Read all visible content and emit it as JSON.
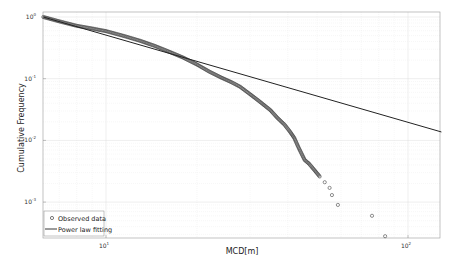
{
  "chart_data": {
    "type": "scatter",
    "scale": {
      "x": "log",
      "y": "log"
    },
    "xlabel": "MCD[m]",
    "ylabel": "Cumulative Frequency",
    "xlim": [
      6.2,
      129
    ],
    "ylim": [
      0.00025,
      1.0
    ],
    "grid": true,
    "legend_position": "lower left",
    "x_ticks": [
      {
        "value": 10,
        "label": "10",
        "exp": "1"
      },
      {
        "value": 100,
        "label": "10",
        "exp": "2"
      }
    ],
    "y_ticks": [
      {
        "value": 1,
        "label": "10",
        "exp": "0"
      },
      {
        "value": 0.1,
        "label": "10",
        "exp": "-1"
      },
      {
        "value": 0.01,
        "label": "10",
        "exp": "-2"
      },
      {
        "value": 0.001,
        "label": "10",
        "exp": "-3"
      }
    ],
    "series": [
      {
        "name": "Observed data",
        "marker": "circle-open",
        "x": [
          6.2,
          7.0,
          8.0,
          9.0,
          10,
          11.5,
          13,
          14.5,
          16.3,
          18,
          20,
          22,
          24,
          26,
          27.8,
          30,
          32,
          35,
          37,
          39,
          40.6,
          42,
          43.5,
          45.5,
          47,
          49,
          51,
          53,
          55,
          56,
          58.6,
          76,
          84
        ],
        "y": [
          1.0,
          0.85,
          0.72,
          0.65,
          0.59,
          0.49,
          0.41,
          0.34,
          0.27,
          0.22,
          0.17,
          0.13,
          0.105,
          0.088,
          0.074,
          0.056,
          0.044,
          0.031,
          0.023,
          0.018,
          0.014,
          0.011,
          0.0075,
          0.0048,
          0.0042,
          0.0033,
          0.0026,
          0.0021,
          0.0017,
          0.0013,
          0.0009,
          0.0006,
          0.00028
        ]
      },
      {
        "name": "Power law fitting",
        "line": "solid",
        "x": [
          6.2,
          129
        ],
        "y": [
          1.0,
          0.0137
        ]
      }
    ]
  },
  "legend": {
    "items": [
      {
        "label": "Observed data",
        "symbol": "circle"
      },
      {
        "label": "Power law fitting",
        "symbol": "line"
      }
    ]
  },
  "colors": {
    "data": "#444444",
    "line": "#222222",
    "grid": "#e6e6e6",
    "axis": "#888888"
  }
}
